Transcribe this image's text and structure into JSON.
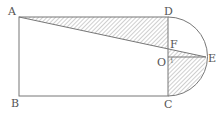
{
  "diagram": {
    "type": "geometry",
    "colors": {
      "line": "#777777",
      "hatch": "#888888",
      "label": "#555555",
      "background": "#ffffff"
    },
    "points": {
      "A": {
        "label": "A",
        "x": 19,
        "y": 17
      },
      "B": {
        "label": "B",
        "x": 19,
        "y": 96
      },
      "C": {
        "label": "C",
        "x": 168,
        "y": 96
      },
      "D": {
        "label": "D",
        "x": 168,
        "y": 17
      },
      "O": {
        "label": "O",
        "x": 168,
        "y": 57
      },
      "E": {
        "label": "E",
        "x": 206,
        "y": 57
      },
      "F": {
        "label": "F",
        "x": 168,
        "y": 49
      }
    },
    "angle_mark": "1",
    "shaded_regions": [
      "triangle ADF",
      "region FEC (triangle FOE + quarter disc OEC)"
    ]
  }
}
